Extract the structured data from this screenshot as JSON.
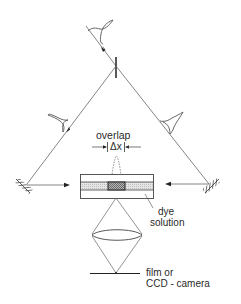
{
  "diagram": {
    "type": "optical-setup",
    "labels": {
      "overlap": "overlap",
      "delta_x": "Δx",
      "dye_line1": "dye",
      "dye_line2": "solution",
      "film_line1": "film or",
      "film_line2": "CCD - camera"
    },
    "components": [
      {
        "name": "incoming-pulse",
        "kind": "pulse-shape"
      },
      {
        "name": "beamsplitter",
        "kind": "beamsplitter"
      },
      {
        "name": "left-pulse",
        "kind": "pulse-shape"
      },
      {
        "name": "right-pulse",
        "kind": "pulse-shape"
      },
      {
        "name": "left-mirror",
        "kind": "mirror"
      },
      {
        "name": "right-mirror",
        "kind": "mirror"
      },
      {
        "name": "dye-cell",
        "kind": "cuvette"
      },
      {
        "name": "overlap-region",
        "kind": "overlap"
      },
      {
        "name": "lens",
        "kind": "lens"
      },
      {
        "name": "detector",
        "kind": "film-or-ccd"
      }
    ],
    "colors": {
      "line": "#555555",
      "dark": "#222222",
      "stripe_fill": "#d9d9d9",
      "overlap_fill": "#9a9a9a"
    }
  }
}
